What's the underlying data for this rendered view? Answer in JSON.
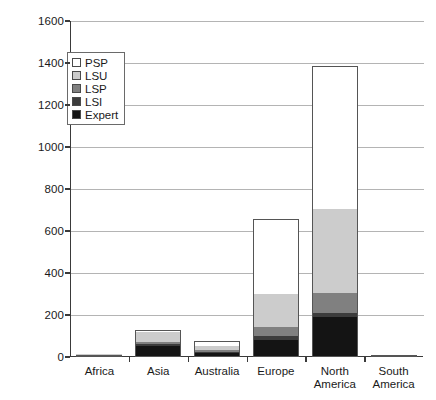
{
  "chart_data": {
    "type": "bar",
    "subtype": "stacked-bar",
    "title": "",
    "xlabel": "",
    "ylabel": "",
    "ylim": [
      0,
      1600
    ],
    "yticks": [
      0,
      200,
      400,
      600,
      800,
      1000,
      1200,
      1400,
      1600
    ],
    "grid": true,
    "legend_position": "upper-left-inside",
    "categories": [
      "Africa",
      "Asia",
      "Australia",
      "Europe",
      "North America",
      "South America"
    ],
    "series": [
      {
        "name": "Expert",
        "color": "#141414",
        "values": [
          4,
          52,
          18,
          80,
          190,
          2
        ]
      },
      {
        "name": "LSI",
        "color": "#3c3c3c",
        "values": [
          2,
          8,
          6,
          22,
          20,
          1
        ]
      },
      {
        "name": "LSP",
        "color": "#808080",
        "values": [
          2,
          10,
          8,
          40,
          95,
          0
        ]
      },
      {
        "name": "LSU",
        "color": "#cccccc",
        "values": [
          2,
          48,
          20,
          160,
          400,
          0
        ]
      },
      {
        "name": "PSP",
        "color": "#ffffff",
        "values": [
          0,
          12,
          23,
          353,
          680,
          0
        ]
      }
    ],
    "totals": [
      10,
      130,
      75,
      655,
      1385,
      3
    ]
  },
  "legend": {
    "items": [
      {
        "label": "PSP",
        "color": "#ffffff"
      },
      {
        "label": "LSU",
        "color": "#cccccc"
      },
      {
        "label": "LSP",
        "color": "#808080"
      },
      {
        "label": "LSI",
        "color": "#3c3c3c"
      },
      {
        "label": "Expert",
        "color": "#141414"
      }
    ]
  },
  "axis": {
    "y_tick_labels": [
      "1600",
      "1400",
      "1200",
      "1000",
      "800",
      "600",
      "400",
      "200",
      "0"
    ],
    "x_tick_labels": [
      {
        "line1": "Africa",
        "line2": ""
      },
      {
        "line1": "Asia",
        "line2": ""
      },
      {
        "line1": "Australia",
        "line2": ""
      },
      {
        "line1": "Europe",
        "line2": ""
      },
      {
        "line1": "North",
        "line2": "America"
      },
      {
        "line1": "South",
        "line2": "America"
      }
    ]
  }
}
